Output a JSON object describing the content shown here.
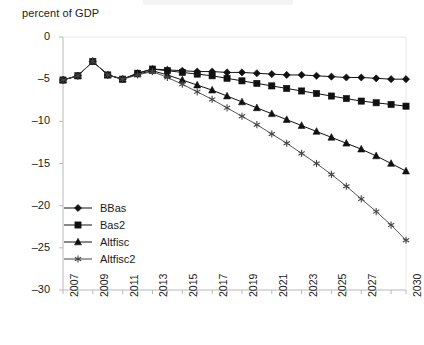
{
  "chart_data": {
    "type": "line",
    "title": "",
    "ylabel": "percent of GDP",
    "xlabel": "",
    "ylim": [
      -30,
      0
    ],
    "xlim": [
      2007,
      2030
    ],
    "grid": false,
    "legend_position": "inside-lower-left",
    "y_ticks": [
      0,
      -5,
      -10,
      -15,
      -20,
      -25,
      -30
    ],
    "y_tick_labels": [
      "0",
      "–5",
      "–10",
      "–15",
      "–20",
      "–25",
      "–30"
    ],
    "x_ticks": [
      2007,
      2008,
      2009,
      2010,
      2011,
      2012,
      2013,
      2014,
      2015,
      2016,
      2017,
      2018,
      2019,
      2020,
      2021,
      2022,
      2023,
      2024,
      2025,
      2026,
      2027,
      2028,
      2029,
      2030
    ],
    "x_tick_labels_shown": [
      "2007",
      "2009",
      "2011",
      "2013",
      "2015",
      "2017",
      "2019",
      "2021",
      "2023",
      "2025",
      "2027",
      "2030"
    ],
    "x": [
      2007,
      2008,
      2009,
      2010,
      2011,
      2012,
      2013,
      2014,
      2015,
      2016,
      2017,
      2018,
      2019,
      2020,
      2021,
      2022,
      2023,
      2024,
      2025,
      2026,
      2027,
      2028,
      2029,
      2030
    ],
    "series": [
      {
        "name": "BBas",
        "marker": "diamond",
        "color": "#111111",
        "values": [
          -5.1,
          -4.6,
          -2.9,
          -4.5,
          -5.0,
          -4.3,
          -3.8,
          -3.9,
          -4.0,
          -4.1,
          -4.1,
          -4.2,
          -4.2,
          -4.3,
          -4.4,
          -4.5,
          -4.5,
          -4.6,
          -4.7,
          -4.8,
          -4.8,
          -4.9,
          -5.0,
          -5.0
        ]
      },
      {
        "name": "Bas2",
        "marker": "square",
        "color": "#111111",
        "values": [
          -5.1,
          -4.6,
          -2.9,
          -4.5,
          -5.0,
          -4.3,
          -3.8,
          -4.0,
          -4.2,
          -4.4,
          -4.6,
          -4.9,
          -5.2,
          -5.5,
          -5.8,
          -6.1,
          -6.4,
          -6.7,
          -7.0,
          -7.3,
          -7.6,
          -7.8,
          -8.0,
          -8.2
        ]
      },
      {
        "name": "Altfisc",
        "marker": "triangle",
        "color": "#111111",
        "values": [
          -5.1,
          -4.6,
          -2.9,
          -4.5,
          -5.0,
          -4.4,
          -4.0,
          -4.5,
          -5.1,
          -5.7,
          -6.3,
          -7.0,
          -7.7,
          -8.4,
          -9.1,
          -9.8,
          -10.5,
          -11.2,
          -11.9,
          -12.6,
          -13.3,
          -14.1,
          -15.0,
          -15.9
        ]
      },
      {
        "name": "Altfisc2",
        "marker": "asterisk",
        "color": "#444444",
        "values": [
          -5.1,
          -4.6,
          -2.9,
          -4.5,
          -5.0,
          -4.5,
          -4.1,
          -4.8,
          -5.6,
          -6.5,
          -7.4,
          -8.4,
          -9.4,
          -10.4,
          -11.5,
          -12.6,
          -13.8,
          -15.0,
          -16.3,
          -17.7,
          -19.2,
          -20.7,
          -22.3,
          -24.1
        ]
      }
    ]
  },
  "legend": {
    "items": [
      {
        "label": "BBas"
      },
      {
        "label": "Bas2"
      },
      {
        "label": "Altfisc"
      },
      {
        "label": "Altfisc2"
      }
    ]
  }
}
